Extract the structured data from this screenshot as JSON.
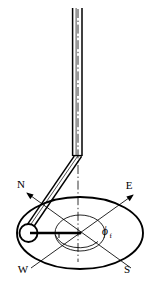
{
  "figure": {
    "background_color": "#ffffff",
    "stroke_color": "#000000",
    "width": 158,
    "height": 287
  },
  "labels": {
    "north": "N",
    "east": "E",
    "west": "W",
    "south": "S",
    "angle_symbol": "ϕ",
    "angle_subscript": "f"
  },
  "geometry": {
    "rod": {
      "top_y": 8,
      "elbow_y": 155,
      "left_x": 72.5,
      "right_x": 82.0,
      "axis_x": 77.5
    },
    "arm": {
      "from_x": 78,
      "from_y": 155,
      "to_x": 29,
      "to_y": 232
    },
    "bob": {
      "cx": 28.5,
      "cy": 233,
      "r": 9.0
    },
    "center": {
      "cx": 80.0,
      "cy": 233.0
    },
    "outer_ellipse": {
      "rx": 63.0,
      "ry": 36.0
    },
    "inner_ellipse": {
      "rx": 25.0,
      "ry": 18.0
    },
    "radius_line": {
      "x1": 37,
      "y1": 233,
      "x2": 80,
      "y2": 233
    },
    "axis_dashdot": {
      "x": 78,
      "y_top": 8,
      "y_bottom": 262
    },
    "compass": {
      "n_end": {
        "x": 27,
        "y": 193
      },
      "e_end": {
        "x": 133,
        "y": 195
      },
      "w_end": {
        "x": 31,
        "y": 268
      },
      "s_end": {
        "x": 131,
        "y": 268
      }
    }
  },
  "label_positions": {
    "north": {
      "x": 21,
      "y": 188
    },
    "east": {
      "x": 127,
      "y": 189
    },
    "west": {
      "x": 22,
      "y": 272
    },
    "south": {
      "x": 126,
      "y": 272
    },
    "angle": {
      "x": 102,
      "y": 236
    }
  }
}
